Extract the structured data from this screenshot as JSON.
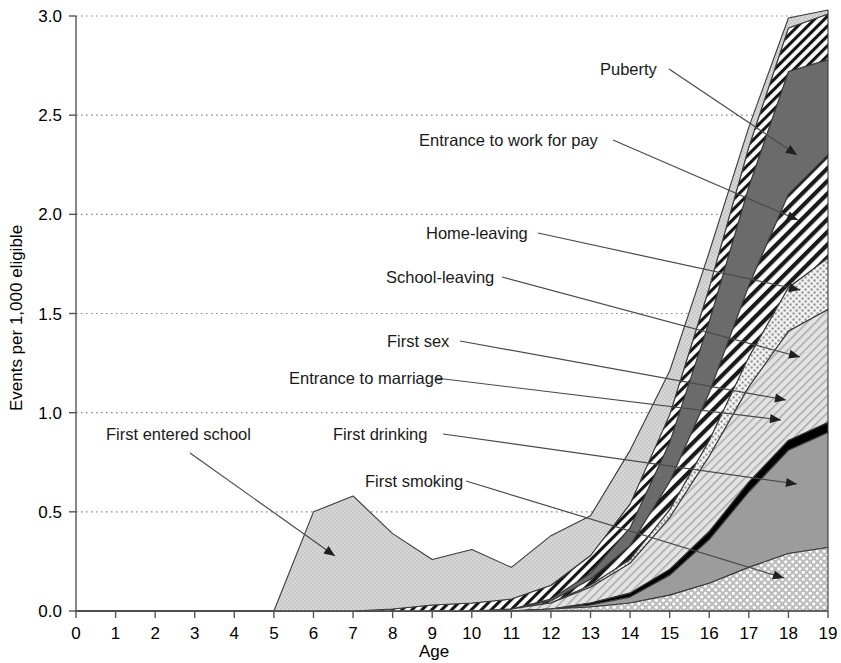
{
  "chart_data": {
    "type": "area",
    "stacked": true,
    "title": "",
    "xlabel": "Age",
    "ylabel": "Events per 1,000 eligible",
    "x": [
      0,
      1,
      2,
      3,
      4,
      5,
      6,
      7,
      8,
      9,
      10,
      11,
      12,
      13,
      14,
      15,
      16,
      17,
      18,
      19
    ],
    "xlim": [
      0,
      19
    ],
    "ylim": [
      0.0,
      3.0
    ],
    "xticks": [
      0,
      1,
      2,
      3,
      4,
      5,
      6,
      7,
      8,
      9,
      10,
      11,
      12,
      13,
      14,
      15,
      16,
      17,
      18,
      19
    ],
    "xtick_labels": [
      "0",
      "1",
      "2",
      "3",
      "4",
      "5",
      "6",
      "7",
      "8",
      "9",
      "10",
      "11",
      "12",
      "13",
      "14",
      "15",
      "16",
      "17",
      "18",
      "19"
    ],
    "yticks": [
      0.0,
      0.5,
      1.0,
      1.5,
      2.0,
      2.5,
      3.0
    ],
    "ytick_labels": [
      "0.0",
      "0.5",
      "1.0",
      "1.5",
      "2.0",
      "2.5",
      "3.0"
    ],
    "grid": "horizontal-dotted",
    "legend": "inline-annotations",
    "stack_order_bottom_to_top": [
      "First drinking",
      "Entrance to marriage",
      "First sex",
      "School-leaving",
      "Home-leaving",
      "Entrance to work for pay",
      "Puberty",
      "First smoking",
      "First entered school"
    ],
    "series": [
      {
        "name": "First entered school",
        "pattern": "light-gray-stipple",
        "color": "#d0d0d0",
        "values": [
          0,
          0,
          0,
          0,
          0,
          0.0,
          0.5,
          0.58,
          0.38,
          0.23,
          0.27,
          0.16,
          0.25,
          0.2,
          0.27,
          0.22,
          0.18,
          0.1,
          0.05,
          0.02
        ]
      },
      {
        "name": "First smoking",
        "pattern": "diagonal-hatch-black",
        "color": "#ffffff",
        "values": [
          0,
          0,
          0,
          0,
          0,
          0,
          0,
          0,
          0.01,
          0.03,
          0.04,
          0.05,
          0.07,
          0.09,
          0.12,
          0.14,
          0.17,
          0.2,
          0.22,
          0.23
        ]
      },
      {
        "name": "First drinking",
        "pattern": "white-dot-on-gray",
        "color": "#c9c9c9",
        "values": [
          0,
          0,
          0,
          0,
          0,
          0,
          0,
          0,
          0,
          0,
          0,
          0,
          0.01,
          0.02,
          0.04,
          0.08,
          0.14,
          0.22,
          0.29,
          0.32
        ]
      },
      {
        "name": "Entrance to marriage",
        "pattern": "solid-medium-gray",
        "color": "#9e9e9e",
        "values": [
          0,
          0,
          0,
          0,
          0,
          0,
          0,
          0,
          0,
          0,
          0,
          0,
          0,
          0.01,
          0.03,
          0.1,
          0.22,
          0.38,
          0.52,
          0.58
        ]
      },
      {
        "name": "First sex",
        "pattern": "solid-black",
        "color": "#000000",
        "values": [
          0,
          0,
          0,
          0,
          0,
          0,
          0,
          0,
          0,
          0,
          0,
          0,
          0,
          0.01,
          0.02,
          0.03,
          0.04,
          0.05,
          0.05,
          0.05
        ]
      },
      {
        "name": "School-leaving",
        "pattern": "light-diagonal-hatch",
        "color": "#e0e0e0",
        "values": [
          0,
          0,
          0,
          0,
          0,
          0,
          0,
          0,
          0,
          0,
          0,
          0.01,
          0.03,
          0.08,
          0.15,
          0.26,
          0.38,
          0.48,
          0.55,
          0.57
        ]
      },
      {
        "name": "Home-leaving",
        "pattern": "gray-dot-stipple",
        "color": "#d8d8d8",
        "values": [
          0,
          0,
          0,
          0,
          0,
          0,
          0,
          0,
          0,
          0,
          0,
          0,
          0,
          0.01,
          0.02,
          0.04,
          0.08,
          0.15,
          0.22,
          0.26
        ]
      },
      {
        "name": "Entrance to work for pay",
        "pattern": "bold-diagonal-stripe",
        "color": "#ffffff",
        "values": [
          0,
          0,
          0,
          0,
          0,
          0,
          0,
          0,
          0,
          0,
          0,
          0,
          0.01,
          0.03,
          0.07,
          0.14,
          0.24,
          0.36,
          0.47,
          0.52
        ]
      },
      {
        "name": "Puberty",
        "pattern": "solid-dark-gray",
        "color": "#6e6e6e",
        "values": [
          0,
          0,
          0,
          0,
          0,
          0,
          0,
          0,
          0,
          0,
          0,
          0,
          0.01,
          0.03,
          0.09,
          0.2,
          0.36,
          0.5,
          0.62,
          0.48
        ]
      }
    ],
    "annotations": [
      {
        "label": "Puberty",
        "text_x": 600,
        "text_y": 75,
        "anchor": "start",
        "line": [
          [
            669,
            69
          ],
          [
            797,
            155
          ]
        ]
      },
      {
        "label": "Entrance to work for pay",
        "text_x": 419,
        "text_y": 146,
        "anchor": "start",
        "line": [
          [
            613,
            140
          ],
          [
            798,
            220
          ]
        ]
      },
      {
        "label": "Home-leaving",
        "text_x": 426,
        "text_y": 239,
        "anchor": "start",
        "line": [
          [
            538,
            233
          ],
          [
            800,
            290
          ]
        ]
      },
      {
        "label": "School-leaving",
        "text_x": 386,
        "text_y": 283,
        "anchor": "start",
        "line": [
          [
            502,
            277
          ],
          [
            800,
            357
          ]
        ]
      },
      {
        "label": "First sex",
        "text_x": 387,
        "text_y": 347,
        "anchor": "start",
        "line": [
          [
            460,
            341
          ],
          [
            786,
            400
          ]
        ]
      },
      {
        "label": "Entrance to marriage",
        "text_x": 289,
        "text_y": 384,
        "anchor": "start",
        "line": [
          [
            436,
            378
          ],
          [
            781,
            420
          ]
        ]
      },
      {
        "label": "First drinking",
        "text_x": 333,
        "text_y": 440,
        "anchor": "start",
        "line": [
          [
            443,
            434
          ],
          [
            797,
            484
          ]
        ]
      },
      {
        "label": "First entered school",
        "text_x": 106,
        "text_y": 440,
        "anchor": "start",
        "line": [
          [
            190,
            453
          ],
          [
            335,
            556
          ]
        ]
      },
      {
        "label": "First smoking",
        "text_x": 365,
        "text_y": 487,
        "anchor": "start",
        "line": [
          [
            466,
            481
          ],
          [
            784,
            578
          ]
        ]
      }
    ]
  },
  "axes": {
    "x_title": "Age",
    "y_title": "Events per 1,000 eligible"
  }
}
